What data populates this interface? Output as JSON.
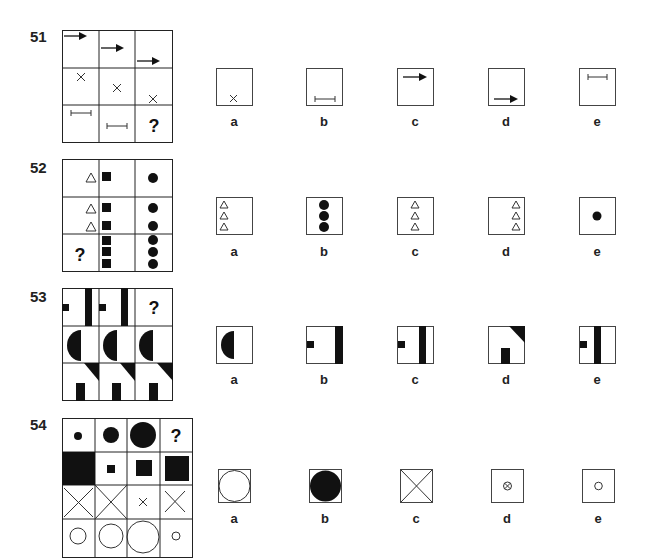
{
  "questions": [
    {
      "number": "51",
      "grid_cells": [
        [
          "arrow-top",
          "arrow-middle",
          "arrow-lower"
        ],
        [
          "x-top",
          "x-middle",
          "x-bottom"
        ],
        [
          "bar-top",
          "bar-middle",
          "?"
        ]
      ],
      "options": [
        {
          "label": "a",
          "content": "x-bottom"
        },
        {
          "label": "b",
          "content": "bar-bottom"
        },
        {
          "label": "c",
          "content": "arrow-top"
        },
        {
          "label": "d",
          "content": "arrow-bottom"
        },
        {
          "label": "e",
          "content": "bar-top"
        }
      ]
    },
    {
      "number": "52",
      "grid_cells": [
        [
          "1 triangle",
          "1 square",
          "1 circle"
        ],
        [
          "2 triangles",
          "2 squares",
          "2 circles"
        ],
        [
          "?",
          "3 squares",
          "3 circles"
        ]
      ],
      "options": [
        {
          "label": "a",
          "content": "3 triangles left"
        },
        {
          "label": "b",
          "content": "3 circles"
        },
        {
          "label": "c",
          "content": "3 triangles center"
        },
        {
          "label": "d",
          "content": "3 triangles right"
        },
        {
          "label": "e",
          "content": "1 circle"
        }
      ]
    },
    {
      "number": "53",
      "grid_cells": [
        [
          "square + bar right",
          "square + bar center",
          "?"
        ],
        [
          "half-circle",
          "half-circle",
          "half-circle"
        ],
        [
          "triangle + block",
          "triangle + block",
          "triangle + block"
        ]
      ],
      "options": [
        {
          "label": "a",
          "content": "half-circle"
        },
        {
          "label": "b",
          "content": "square + bar at edge"
        },
        {
          "label": "c",
          "content": "square + bar right-center"
        },
        {
          "label": "d",
          "content": "triangle + block"
        },
        {
          "label": "e",
          "content": "square + bar center-left"
        }
      ]
    },
    {
      "number": "54",
      "grid_cells": [
        [
          "small dot",
          "medium dot",
          "large dot",
          "?"
        ],
        [
          "large square",
          "small square",
          "medium square",
          "large square"
        ],
        [
          "medium X",
          "large X",
          "small X",
          "medium X"
        ],
        [
          "medium circle",
          "large circle",
          "extra large circle",
          "small circle"
        ]
      ],
      "options": [
        {
          "label": "a",
          "content": "large open circle"
        },
        {
          "label": "b",
          "content": "large filled circle"
        },
        {
          "label": "c",
          "content": "full X"
        },
        {
          "label": "d",
          "content": "tiny circled X"
        },
        {
          "label": "e",
          "content": "small open circle"
        }
      ]
    }
  ],
  "question_mark": "?"
}
